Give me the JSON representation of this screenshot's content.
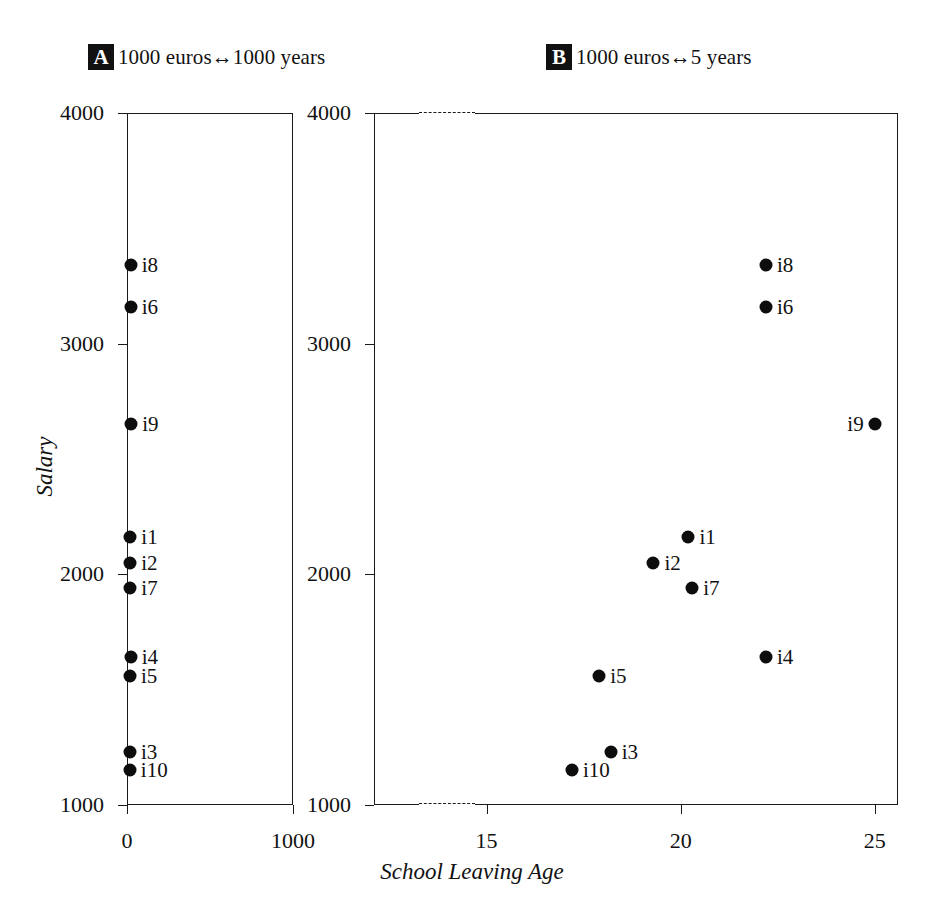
{
  "figure": {
    "panels": [
      {
        "tag": "A",
        "caption": "1000 euros↔1000 years"
      },
      {
        "tag": "B",
        "caption": "1000 euros↔5 years"
      }
    ],
    "xlabel": "School Leaving Age",
    "ylabel": "Salary"
  },
  "chart_data": {
    "type": "scatter",
    "title": "",
    "subtitle": "",
    "xlabel": "School Leaving Age",
    "ylabel": "Salary",
    "grid": false,
    "legend": "none",
    "annotation": "Two panels showing the same ten observations with different aspect-ratio / axis-scaling conventions: panel A uses 1000 euros ↔ 1000 years, panel B uses 1000 euros ↔ 5 years.",
    "point_labels": [
      "i1",
      "i2",
      "i3",
      "i4",
      "i5",
      "i6",
      "i7",
      "i8",
      "i9",
      "i10"
    ],
    "x": [
      20.2,
      19.3,
      18.2,
      22.2,
      17.9,
      22.2,
      20.3,
      22.2,
      25.0,
      17.2
    ],
    "y": [
      2160,
      2050,
      1230,
      1640,
      1560,
      3160,
      1940,
      3340,
      2650,
      1150
    ],
    "panels": [
      {
        "tag": "A",
        "caption": "1000 euros↔1000 years",
        "xlim": [
          0,
          1000
        ],
        "ylim": [
          1000,
          4000
        ],
        "xticks": [
          0,
          1000
        ],
        "xticklabels": [
          "0",
          "1000"
        ],
        "yticks": [
          1000,
          2000,
          3000,
          4000
        ],
        "yticklabels": [
          "1000",
          "2000",
          "3000",
          "4000"
        ],
        "axis_break": false,
        "points": [
          {
            "label": "i1",
            "x": 20.2,
            "y": 2160,
            "label_side": "right"
          },
          {
            "label": "i2",
            "x": 19.3,
            "y": 2050,
            "label_side": "right"
          },
          {
            "label": "i3",
            "x": 18.2,
            "y": 1230,
            "label_side": "right"
          },
          {
            "label": "i4",
            "x": 22.2,
            "y": 1640,
            "label_side": "right"
          },
          {
            "label": "i5",
            "x": 17.9,
            "y": 1560,
            "label_side": "right"
          },
          {
            "label": "i6",
            "x": 22.2,
            "y": 3160,
            "label_side": "right"
          },
          {
            "label": "i7",
            "x": 20.3,
            "y": 1940,
            "label_side": "right"
          },
          {
            "label": "i8",
            "x": 22.2,
            "y": 3340,
            "label_side": "right"
          },
          {
            "label": "i9",
            "x": 25.0,
            "y": 2650,
            "label_side": "right"
          },
          {
            "label": "i10",
            "x": 17.2,
            "y": 1150,
            "label_side": "right"
          }
        ]
      },
      {
        "tag": "B",
        "caption": "1000 euros↔5 years",
        "xlim": [
          12.1,
          25.6
        ],
        "ylim": [
          1000,
          4000
        ],
        "xticks": [
          15,
          20,
          25
        ],
        "xticklabels": [
          "15",
          "20",
          "25"
        ],
        "yticks": [
          1000,
          2000,
          3000,
          4000
        ],
        "yticklabels": [
          "1000",
          "2000",
          "3000",
          "4000"
        ],
        "axis_break": true,
        "points": [
          {
            "label": "i1",
            "x": 20.2,
            "y": 2160,
            "label_side": "right"
          },
          {
            "label": "i2",
            "x": 19.3,
            "y": 2050,
            "label_side": "right"
          },
          {
            "label": "i3",
            "x": 18.2,
            "y": 1230,
            "label_side": "right"
          },
          {
            "label": "i4",
            "x": 22.2,
            "y": 1640,
            "label_side": "right"
          },
          {
            "label": "i5",
            "x": 17.9,
            "y": 1560,
            "label_side": "right"
          },
          {
            "label": "i6",
            "x": 22.2,
            "y": 3160,
            "label_side": "right"
          },
          {
            "label": "i7",
            "x": 20.3,
            "y": 1940,
            "label_side": "right"
          },
          {
            "label": "i8",
            "x": 22.2,
            "y": 3340,
            "label_side": "right"
          },
          {
            "label": "i9",
            "x": 25.0,
            "y": 2650,
            "label_side": "left"
          },
          {
            "label": "i10",
            "x": 17.2,
            "y": 1150,
            "label_side": "right"
          }
        ]
      }
    ]
  }
}
